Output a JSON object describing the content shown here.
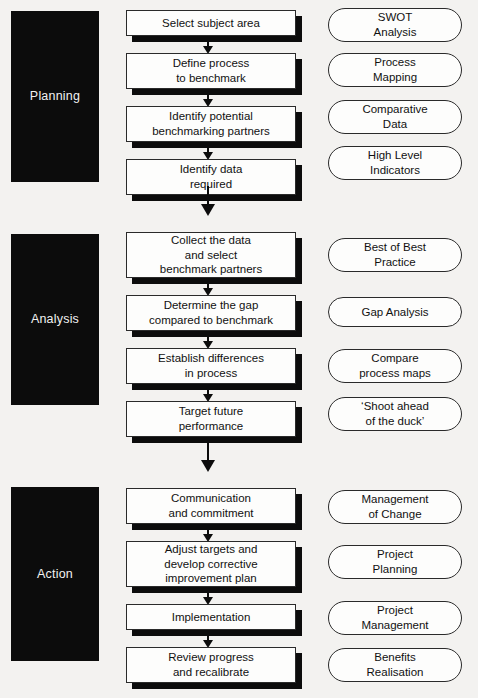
{
  "diagram": {
    "colors": {
      "background": "#f3f2f0",
      "panel": "#0c0c0c",
      "panel_text": "#f2f2f2",
      "box_fill": "#fdfdfc",
      "box_border": "#2a2a2a",
      "shadow": "#0c0c0c",
      "text": "#111111"
    }
  },
  "phases": [
    {
      "id": "planning",
      "label": "Planning",
      "steps": [
        {
          "text": "Select subject area",
          "lines": [
            "Select subject area"
          ]
        },
        {
          "text": "Define process to benchmark",
          "lines": [
            "Define process",
            "to benchmark"
          ]
        },
        {
          "text": "Identify potential benchmarking partners",
          "lines": [
            "Identify potential",
            "benchmarking partners"
          ]
        },
        {
          "text": "Identify data required",
          "lines": [
            "Identify data",
            "required"
          ]
        }
      ],
      "tools": [
        {
          "text": "SWOT Analysis",
          "lines": [
            "SWOT",
            "Analysis"
          ]
        },
        {
          "text": "Process Mapping",
          "lines": [
            "Process",
            "Mapping"
          ]
        },
        {
          "text": "Comparative Data",
          "lines": [
            "Comparative",
            "Data"
          ]
        },
        {
          "text": "High Level Indicators",
          "lines": [
            "High Level",
            "Indicators"
          ]
        }
      ]
    },
    {
      "id": "analysis",
      "label": "Analysis",
      "steps": [
        {
          "text": "Collect the data and select benchmark partners",
          "lines": [
            "Collect the data",
            "and select",
            "benchmark partners"
          ]
        },
        {
          "text": "Determine the gap compared to benchmark",
          "lines": [
            "Determine the gap",
            "compared to benchmark"
          ]
        },
        {
          "text": "Establish differences in process",
          "lines": [
            "Establish differences",
            "in process"
          ]
        },
        {
          "text": "Target future performance",
          "lines": [
            "Target future",
            "performance"
          ]
        }
      ],
      "tools": [
        {
          "text": "Best of Best Practice",
          "lines": [
            "Best of Best",
            "Practice"
          ]
        },
        {
          "text": "Gap Analysis",
          "lines": [
            "Gap Analysis"
          ]
        },
        {
          "text": "Compare process maps",
          "lines": [
            "Compare",
            "process maps"
          ]
        },
        {
          "text": "‘Shoot ahead of the duck’",
          "lines": [
            "‘Shoot ahead",
            "of the duck’"
          ]
        }
      ]
    },
    {
      "id": "action",
      "label": "Action",
      "steps": [
        {
          "text": "Communication and commitment",
          "lines": [
            "Communication",
            "and commitment"
          ]
        },
        {
          "text": "Adjust targets and develop corrective improvement plan",
          "lines": [
            "Adjust targets and",
            "develop corrective",
            "improvement plan"
          ]
        },
        {
          "text": "Implementation",
          "lines": [
            "Implementation"
          ]
        },
        {
          "text": "Review progress and recalibrate",
          "lines": [
            "Review progress",
            "and recalibrate"
          ]
        }
      ],
      "tools": [
        {
          "text": "Management of Change",
          "lines": [
            "Management",
            "of Change"
          ]
        },
        {
          "text": "Project Planning",
          "lines": [
            "Project",
            "Planning"
          ]
        },
        {
          "text": "Project Management",
          "lines": [
            "Project",
            "Management"
          ]
        },
        {
          "text": "Benefits Realisation",
          "lines": [
            "Benefits",
            "Realisation"
          ]
        }
      ]
    }
  ]
}
